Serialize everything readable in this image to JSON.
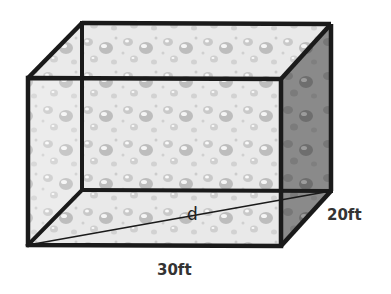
{
  "diagram": {
    "shape": "rectangular-prism",
    "labels": {
      "length": "30ft",
      "width": "20ft",
      "diagonal": "d"
    },
    "colors": {
      "edge": "#1a1a1a",
      "front_face": "#e2e2e2",
      "side_face": "#7a7a7a",
      "top_face": "#ececec",
      "label": "#333333"
    }
  }
}
